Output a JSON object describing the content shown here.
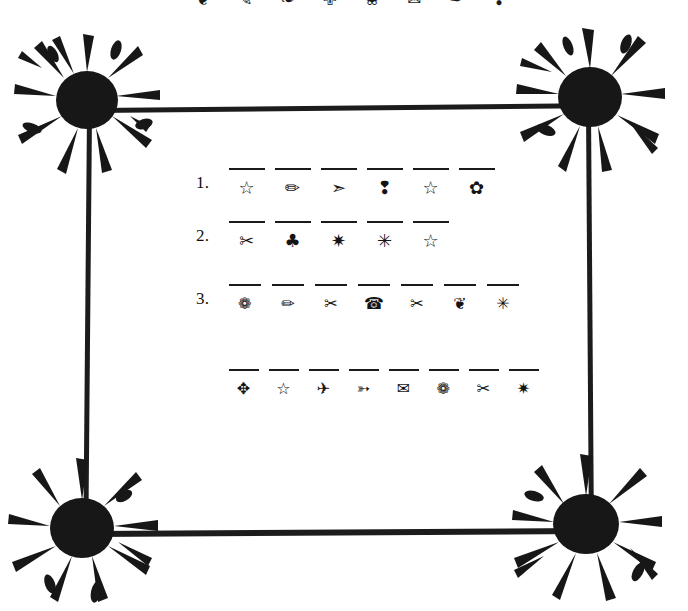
{
  "page": {
    "background_color": "#ffffff",
    "ink_color": "#1a1a1a"
  },
  "top_strip": {
    "description": "cropped row of dingbat symbols at page top edge",
    "glyphs": [
      "❦",
      "✎",
      "❧",
      "✙",
      "❀",
      "✉",
      "✒",
      "❣"
    ]
  },
  "frame": {
    "corners": [
      {
        "name": "top-left-splat",
        "glyph": "ink-splat-burst"
      },
      {
        "name": "top-right-splat",
        "glyph": "ink-splat-burst"
      },
      {
        "name": "bottom-left-splat",
        "glyph": "ink-splat-burst"
      },
      {
        "name": "bottom-right-splat",
        "glyph": "ink-splat-burst"
      }
    ],
    "rules": [
      "top-rule",
      "right-rule",
      "bottom-rule",
      "left-rule"
    ]
  },
  "worksheet": {
    "rows": [
      {
        "number": "1.",
        "slots": [
          {
            "glyph": "☆",
            "name": "star-outline-icon"
          },
          {
            "glyph": "✏",
            "name": "pencil-icon"
          },
          {
            "glyph": "➣",
            "name": "arrow-icon"
          },
          {
            "glyph": "❢",
            "name": "exclamation-icon"
          },
          {
            "glyph": "☆",
            "name": "star-outline-icon"
          },
          {
            "glyph": "✿",
            "name": "flower-icon"
          }
        ]
      },
      {
        "number": "2.",
        "slots": [
          {
            "glyph": "✂",
            "name": "scissors-icon"
          },
          {
            "glyph": "♣",
            "name": "club-icon"
          },
          {
            "glyph": "✷",
            "name": "starburst-icon"
          },
          {
            "glyph": "✳",
            "name": "asterisk-icon"
          },
          {
            "glyph": "☆",
            "name": "star-outline-icon"
          }
        ]
      },
      {
        "number": "3.",
        "slots": [
          {
            "glyph": "❁",
            "name": "flower-rosette-icon"
          },
          {
            "glyph": "✏",
            "name": "pencil-icon"
          },
          {
            "glyph": "✂",
            "name": "scissors-icon"
          },
          {
            "glyph": "☎",
            "name": "telephone-icon"
          },
          {
            "glyph": "✂",
            "name": "scissors-icon"
          },
          {
            "glyph": "❦",
            "name": "heart-leaf-icon"
          },
          {
            "glyph": "✳",
            "name": "asterisk-icon"
          }
        ]
      },
      {
        "number": "",
        "slots": [
          {
            "glyph": "✥",
            "name": "four-arrows-icon"
          },
          {
            "glyph": "☆",
            "name": "star-outline-icon"
          },
          {
            "glyph": "✈",
            "name": "airplane-icon"
          },
          {
            "glyph": "➳",
            "name": "arrow-dot-icon"
          },
          {
            "glyph": "✉",
            "name": "envelope-icon"
          },
          {
            "glyph": "❁",
            "name": "flower-rosette-icon"
          },
          {
            "glyph": "✂",
            "name": "scissors-icon"
          },
          {
            "glyph": "✷",
            "name": "starburst-icon"
          }
        ]
      }
    ]
  }
}
